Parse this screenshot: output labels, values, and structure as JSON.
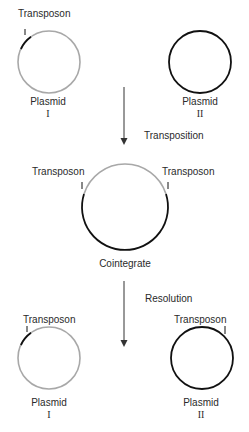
{
  "diagram": {
    "type": "transposition-cointegrate-resolution",
    "colors": {
      "plasmid_I": "#a8a8a8",
      "plasmid_II": "#111111",
      "transposon": "#111111"
    },
    "top": {
      "plasmid_I": {
        "transposon_label": "Transposon",
        "name": "Plasmid",
        "numeral": "I"
      },
      "plasmid_II": {
        "name": "Plasmid",
        "numeral": "II"
      }
    },
    "step1": {
      "label": "Transposition"
    },
    "middle": {
      "left_transposon_label": "Transposon",
      "right_transposon_label": "Transposon",
      "name": "Cointegrate"
    },
    "step2": {
      "label": "Resolution"
    },
    "bottom": {
      "plasmid_I": {
        "transposon_label": "Transposon",
        "name": "Plasmid",
        "numeral": "I"
      },
      "plasmid_II": {
        "transposon_label": "Transposon",
        "name": "Plasmid",
        "numeral": "II"
      }
    }
  }
}
